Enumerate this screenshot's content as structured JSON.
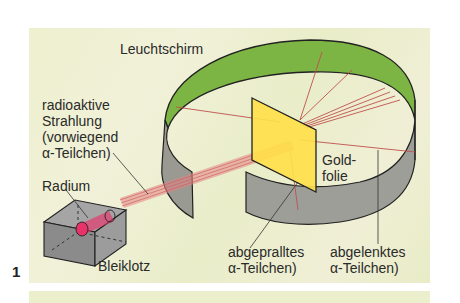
{
  "figure": {
    "number": "1",
    "labels": {
      "screen": "Leuchtschirm",
      "radiation_line1": "radioaktive",
      "radiation_line2": "Strahlung",
      "radiation_line3": "(vorwiegend",
      "radiation_line4": "α-Teilchen)",
      "radium": "Radium",
      "lead_block": "Bleiklotz",
      "gold_line1": "Gold-",
      "gold_line2": "folie",
      "rebounded_line1": "abgepralltes",
      "rebounded_line2": "α-Teilchen)",
      "deflected_line1": "abgelenktes",
      "deflected_line2": "α-Teilchen)"
    }
  },
  "colors": {
    "background": "#eef0d2",
    "screen_green": "#7cb342",
    "ring_gray": "#8e8e8e",
    "gold_foil": "#ffe04a",
    "beam": "#e07070",
    "radium": "#e8326a"
  }
}
